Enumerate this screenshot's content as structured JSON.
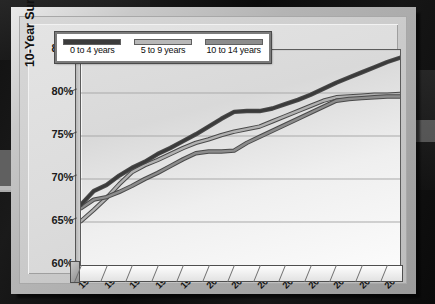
{
  "chart_data": {
    "type": "line",
    "title": "",
    "xlabel": "",
    "ylabel": "10-Year Survival (%)",
    "ylim": [
      60,
      85
    ],
    "xlim": [
      1991,
      2016
    ],
    "grid": true,
    "legend_position": "top-left",
    "ytick_labels": [
      "85%",
      "80%",
      "75%",
      "70%",
      "65%",
      "60%"
    ],
    "ytick_values": [
      85,
      80,
      75,
      70,
      65,
      60
    ],
    "xtick_labels": [
      "1991",
      "1993",
      "1995",
      "1997",
      "1999",
      "2001",
      "2003",
      "2005",
      "2007",
      "2009",
      "2011",
      "2013",
      "2015"
    ],
    "xtick_values": [
      1991,
      1993,
      1995,
      1997,
      1999,
      2001,
      2003,
      2005,
      2007,
      2009,
      2011,
      2013,
      2015
    ],
    "x": [
      1991,
      1992,
      1993,
      1994,
      1995,
      1996,
      1997,
      1998,
      1999,
      2000,
      2001,
      2002,
      2003,
      2004,
      2005,
      2006,
      2007,
      2008,
      2009,
      2010,
      2011,
      2012,
      2013,
      2014,
      2015,
      2016
    ],
    "series": [
      {
        "name": "0 to 4 years",
        "color": "#3b3b3b",
        "values": [
          67.0,
          68.6,
          69.3,
          70.4,
          71.3,
          72.0,
          72.9,
          73.6,
          74.4,
          75.2,
          76.1,
          77.0,
          77.8,
          77.9,
          77.9,
          78.2,
          78.7,
          79.2,
          79.8,
          80.5,
          81.2,
          81.8,
          82.4,
          83.0,
          83.6,
          84.1
        ]
      },
      {
        "name": "5 to 9 years",
        "color": "#b0b0b0",
        "values": [
          65.1,
          66.4,
          67.8,
          69.4,
          70.8,
          71.6,
          72.2,
          72.9,
          73.6,
          74.2,
          74.6,
          75.1,
          75.5,
          75.8,
          76.1,
          76.7,
          77.3,
          77.9,
          78.5,
          79.1,
          79.5,
          79.6,
          79.7,
          79.8,
          79.8,
          79.9
        ]
      },
      {
        "name": "10 to 14 years",
        "color": "#8c8c8c",
        "values": [
          66.6,
          67.6,
          67.9,
          68.5,
          69.2,
          70.0,
          70.7,
          71.5,
          72.3,
          73.0,
          73.2,
          73.2,
          73.3,
          74.2,
          74.9,
          75.6,
          76.3,
          77.0,
          77.7,
          78.4,
          79.1,
          79.3,
          79.4,
          79.5,
          79.6,
          79.6
        ]
      }
    ]
  },
  "legend": {
    "items": [
      {
        "label": "0 to 4 years",
        "color": "#3b3b3b"
      },
      {
        "label": "5 to 9 years",
        "color": "#b8b8b8"
      },
      {
        "label": "10 to 14 years",
        "color": "#8c8c8c"
      }
    ]
  }
}
